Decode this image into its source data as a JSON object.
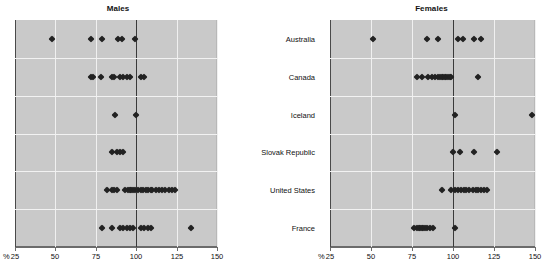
{
  "chart_data": {
    "type": "scatter",
    "subtype": "dot-plot",
    "title": "",
    "xlabel": "%",
    "ylabel": "",
    "xlim": [
      25,
      150
    ],
    "xticks": [
      25,
      50,
      75,
      100,
      125,
      150
    ],
    "xtick_labels": [
      "25",
      "50",
      "75",
      "100",
      "125",
      "150"
    ],
    "reference_line": 100,
    "grid": "vertical white gridlines at ticks, horizontal separators between categories",
    "legend": "none",
    "percent_symbol": "%",
    "categories": [
      "Australia",
      "Canada",
      "Iceland",
      "Slovak Republic",
      "United States",
      "France"
    ],
    "panels": [
      {
        "name": "males",
        "title": "Males",
        "series": [
          {
            "category": "Australia",
            "values": [
              48,
              72,
              79,
              89,
              91,
              99
            ]
          },
          {
            "category": "Canada",
            "values": [
              72,
              73,
              78,
              85,
              86,
              90,
              92,
              94,
              96,
              103,
              105
            ]
          },
          {
            "category": "Iceland",
            "values": [
              87,
              100
            ]
          },
          {
            "category": "Slovak Republic",
            "values": [
              85,
              88,
              90,
              92
            ]
          },
          {
            "category": "United States",
            "values": [
              82,
              85,
              86,
              88,
              93,
              95,
              96,
              97,
              98,
              99,
              101,
              103,
              104,
              106,
              107,
              109,
              110,
              112,
              114,
              116,
              118,
              120,
              122,
              124
            ]
          },
          {
            "category": "France",
            "values": [
              79,
              85,
              90,
              92,
              94,
              96,
              98,
              103,
              105,
              107,
              109,
              134
            ]
          }
        ]
      },
      {
        "name": "females",
        "title": "Females",
        "series": [
          {
            "category": "Australia",
            "values": [
              51,
              84,
              91,
              103,
              106,
              113,
              117
            ]
          },
          {
            "category": "Canada",
            "values": [
              78,
              81,
              85,
              87,
              89,
              91,
              92,
              93,
              94,
              95,
              96,
              97,
              98,
              99,
              115
            ]
          },
          {
            "category": "Iceland",
            "values": [
              101,
              148
            ]
          },
          {
            "category": "Slovak Republic",
            "values": [
              100,
              104,
              113,
              127
            ]
          },
          {
            "category": "United States",
            "values": [
              93,
              99,
              101,
              103,
              105,
              107,
              108,
              110,
              112,
              114,
              115,
              117,
              119,
              121
            ]
          },
          {
            "category": "France",
            "values": [
              76,
              78,
              79,
              80,
              81,
              82,
              83,
              84,
              86,
              88,
              101
            ]
          }
        ]
      }
    ]
  },
  "panels": {
    "males": {
      "title": "Males"
    },
    "females": {
      "title": "Females"
    }
  },
  "axis": {
    "percent_label": "%",
    "ticks": [
      "25",
      "50",
      "75",
      "100",
      "125",
      "150"
    ]
  },
  "category_labels": [
    "Australia",
    "Canada",
    "Iceland",
    "Slovak Republic",
    "United States",
    "France"
  ],
  "colors": {
    "plot_background": "#c9c9c9",
    "dot": "#222222",
    "reference_line": "#3a3a3a",
    "gridline": "#f0f0f0",
    "text": "#111111",
    "page_background": "#ffffff"
  }
}
